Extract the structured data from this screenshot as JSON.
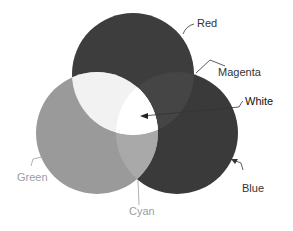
{
  "diagram": {
    "circles": [
      {
        "name": "Red",
        "cx": 133,
        "cy": 74,
        "r": 61,
        "fill": "#3d3d3d"
      },
      {
        "name": "Green",
        "cx": 97,
        "cy": 133,
        "r": 61,
        "fill": "#9a9a9a"
      },
      {
        "name": "Blue",
        "cx": 177,
        "cy": 133,
        "r": 61,
        "fill": "#3a3a3a"
      }
    ],
    "overlaps": {
      "red_green": {
        "name": "Yellow",
        "fill": "#f2f2f2"
      },
      "red_blue": {
        "name": "Magenta",
        "fill": "#454545"
      },
      "green_blue": {
        "name": "Cyan",
        "fill": "#a9a9a9"
      },
      "all": {
        "name": "White",
        "fill": "#ffffff"
      }
    },
    "labels": {
      "red": "Red",
      "magenta": "Magenta",
      "white": "White",
      "green": "Green",
      "cyan": "Cyan",
      "blue": "Blue"
    },
    "colors": {
      "dark_label": "#333333",
      "light_label": "#9d9d9d",
      "leader_line": "#333333"
    }
  }
}
